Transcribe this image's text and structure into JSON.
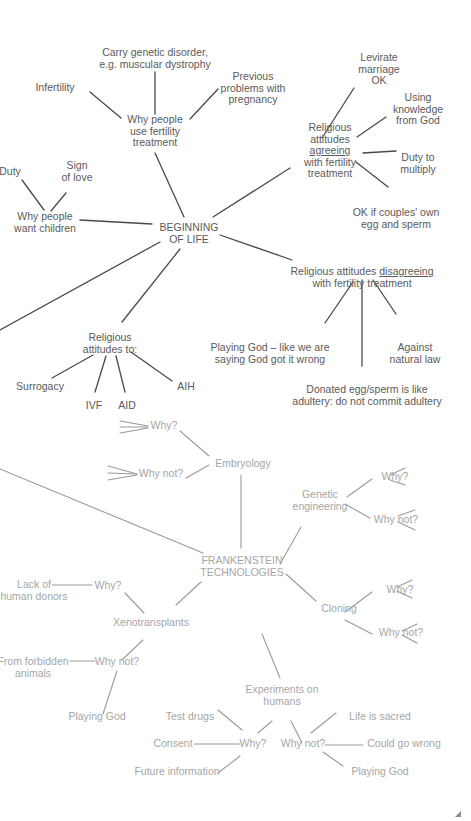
{
  "colors": {
    "dark_text": "#5a5a5a",
    "dark_line": "#4a4a4a",
    "light_text": "#a6a6a6",
    "light_line": "#9a9a9a",
    "background": "#ffffff"
  },
  "beginning_of_life": {
    "center": {
      "lines": [
        "BEGINNING",
        "OF LIFE"
      ]
    },
    "why_fertility": {
      "label": {
        "lines": [
          "Why people",
          "use fertility",
          "treatment"
        ]
      },
      "reasons": [
        {
          "lines": [
            "Carry genetic disorder,",
            "e.g. muscular dystrophy"
          ]
        },
        {
          "lines": [
            "Infertility"
          ]
        },
        {
          "lines": [
            "Previous",
            "problems with",
            "pregnancy"
          ]
        }
      ]
    },
    "why_children": {
      "label": {
        "lines": [
          "Why people",
          "want children"
        ]
      },
      "reasons": [
        {
          "lines": [
            "Duty"
          ]
        },
        {
          "lines": [
            "Sign",
            "of love"
          ]
        }
      ]
    },
    "agreeing": {
      "label": {
        "lines": [
          "Religious",
          "attitudes",
          "agreeing",
          "with fertility",
          "treatment"
        ],
        "underline_line": 2
      },
      "points": [
        {
          "lines": [
            "Levirate",
            "marriage",
            "OK"
          ]
        },
        {
          "lines": [
            "Using",
            "knowledge",
            "from God"
          ]
        },
        {
          "lines": [
            "Duty to",
            "multiply"
          ]
        },
        {
          "lines": [
            "OK if couples' own",
            "egg and sperm"
          ]
        }
      ]
    },
    "disagreeing": {
      "label": {
        "prefix": "Religious attitudes ",
        "underlined": "disagreeing",
        "line2": "with fertility treatment"
      },
      "points": [
        {
          "lines": [
            "Playing God – like we are",
            "saying God got it wrong"
          ]
        },
        {
          "lines": [
            "Against",
            "natural law"
          ]
        },
        {
          "lines": [
            "Donated egg/sperm is like",
            "adultery: do not commit adultery"
          ]
        }
      ]
    },
    "attitudes_to": {
      "label": {
        "lines": [
          "Religious",
          "attitudes to:"
        ]
      },
      "items": [
        {
          "lines": [
            "Surrogacy"
          ]
        },
        {
          "lines": [
            "IVF"
          ]
        },
        {
          "lines": [
            "AID"
          ]
        },
        {
          "lines": [
            "AIH"
          ]
        }
      ]
    }
  },
  "frankenstein": {
    "center": {
      "lines": [
        "FRANKENSTEIN",
        "TECHNOLOGIES"
      ]
    },
    "embryology": {
      "label": {
        "lines": [
          "Embryology"
        ]
      },
      "why": {
        "lines": [
          "Why?"
        ]
      },
      "why_not": {
        "lines": [
          "Why not?"
        ]
      }
    },
    "genetic_engineering": {
      "label": {
        "lines": [
          "Genetic",
          "engineering"
        ]
      },
      "why": {
        "lines": [
          "Why?"
        ]
      },
      "why_not": {
        "lines": [
          "Why not?"
        ]
      }
    },
    "cloning": {
      "label": {
        "lines": [
          "Cloning"
        ]
      },
      "why": {
        "lines": [
          "Why?"
        ]
      },
      "why_not": {
        "lines": [
          "Why not?"
        ]
      }
    },
    "xenotransplants": {
      "label": {
        "lines": [
          "Xenotransplants"
        ]
      },
      "why": {
        "lines": [
          "Why?"
        ]
      },
      "why_reason": {
        "lines": [
          "Lack of",
          "human donors"
        ]
      },
      "why_not": {
        "lines": [
          "Why not?"
        ]
      },
      "why_not_reasons": [
        {
          "lines": [
            "From forbidden",
            "animals"
          ]
        },
        {
          "lines": [
            "Playing God"
          ]
        }
      ]
    },
    "experiments": {
      "label": {
        "lines": [
          "Experiments on",
          "humans"
        ]
      },
      "why": {
        "lines": [
          "Why?"
        ]
      },
      "why_reasons": [
        {
          "lines": [
            "Test drugs"
          ]
        },
        {
          "lines": [
            "Consent"
          ]
        },
        {
          "lines": [
            "Future information"
          ]
        }
      ],
      "why_not": {
        "lines": [
          "Why not?"
        ]
      },
      "why_not_reasons": [
        {
          "lines": [
            "Life is sacred"
          ]
        },
        {
          "lines": [
            "Could go wrong"
          ]
        },
        {
          "lines": [
            "Playing God"
          ]
        }
      ]
    }
  },
  "edges": {
    "dark": [
      [
        155,
        72,
        155,
        114
      ],
      [
        90,
        92,
        121,
        118
      ],
      [
        218,
        89,
        190,
        119
      ],
      [
        155,
        153,
        184,
        217
      ],
      [
        22,
        180,
        44,
        210
      ],
      [
        66,
        193,
        51,
        211
      ],
      [
        80,
        220,
        152,
        224
      ],
      [
        213,
        217,
        290,
        168
      ],
      [
        354,
        88,
        322,
        138
      ],
      [
        386,
        117,
        357,
        137
      ],
      [
        396,
        151,
        363,
        153
      ],
      [
        356,
        162,
        388,
        187
      ],
      [
        220,
        235,
        292,
        260
      ],
      [
        353,
        282,
        325,
        323
      ],
      [
        362,
        280,
        362,
        366
      ],
      [
        373,
        280,
        396,
        314
      ],
      [
        160,
        242,
        0,
        330
      ],
      [
        180,
        249,
        122,
        322
      ],
      [
        93,
        355,
        52,
        378
      ],
      [
        106,
        356,
        95,
        392
      ],
      [
        116,
        356,
        125,
        392
      ],
      [
        131,
        352,
        172,
        381
      ]
    ],
    "light": [
      [
        120,
        421,
        148,
        426
      ],
      [
        120,
        427,
        148,
        427
      ],
      [
        120,
        433,
        148,
        428
      ],
      [
        108,
        466,
        137,
        474
      ],
      [
        108,
        473,
        137,
        474
      ],
      [
        108,
        480,
        137,
        475
      ],
      [
        180,
        431,
        209,
        456
      ],
      [
        186,
        478,
        209,
        465
      ],
      [
        241,
        475,
        241,
        548
      ],
      [
        0,
        469,
        203,
        553
      ],
      [
        280,
        564,
        301,
        527
      ],
      [
        347,
        497,
        372,
        479
      ],
      [
        345,
        504,
        370,
        518
      ],
      [
        390,
        475,
        405,
        468
      ],
      [
        390,
        480,
        405,
        485
      ],
      [
        398,
        516,
        415,
        510
      ],
      [
        398,
        522,
        415,
        530
      ],
      [
        286,
        574,
        316,
        601
      ],
      [
        345,
        612,
        372,
        592
      ],
      [
        345,
        620,
        372,
        634
      ],
      [
        397,
        587,
        412,
        580
      ],
      [
        397,
        591,
        412,
        598
      ],
      [
        402,
        631,
        417,
        624
      ],
      [
        402,
        635,
        417,
        643
      ],
      [
        52,
        585,
        92,
        585
      ],
      [
        125,
        593,
        144,
        613
      ],
      [
        176,
        605,
        201,
        582
      ],
      [
        70,
        661,
        95,
        661
      ],
      [
        143,
        640,
        122,
        660
      ],
      [
        117,
        671,
        103,
        714
      ],
      [
        262,
        634,
        280,
        678
      ],
      [
        218,
        710,
        242,
        730
      ],
      [
        194,
        744,
        240,
        744
      ],
      [
        240,
        756,
        218,
        773
      ],
      [
        272,
        721,
        258,
        733
      ],
      [
        291,
        721,
        302,
        743
      ],
      [
        311,
        733,
        336,
        713
      ],
      [
        325,
        745,
        363,
        745
      ],
      [
        323,
        752,
        343,
        766
      ]
    ]
  },
  "nodes": [
    {
      "id": "carry_genetic",
      "x": 155,
      "y": 47,
      "cls": "dark",
      "ref": "beginning_of_life.why_fertility.reasons.0.lines",
      "name": "node-carry-genetic-disorder"
    },
    {
      "id": "infertility",
      "x": 55,
      "y": 82,
      "cls": "dark",
      "ref": "beginning_of_life.why_fertility.reasons.1.lines",
      "name": "node-infertility"
    },
    {
      "id": "previous_problems",
      "x": 253,
      "y": 71,
      "cls": "dark",
      "ref": "beginning_of_life.why_fertility.reasons.2.lines",
      "name": "node-previous-problems-pregnancy"
    },
    {
      "id": "why_fertility",
      "x": 155,
      "y": 114,
      "cls": "dark",
      "ref": "beginning_of_life.why_fertility.label.lines",
      "name": "node-why-use-fertility-treatment"
    },
    {
      "id": "duty",
      "x": 10,
      "y": 166,
      "cls": "dark",
      "ref": "beginning_of_life.why_children.reasons.0.lines",
      "name": "node-duty"
    },
    {
      "id": "sign_love",
      "x": 77,
      "y": 160,
      "cls": "dark",
      "ref": "beginning_of_life.why_children.reasons.1.lines",
      "name": "node-sign-of-love"
    },
    {
      "id": "why_children",
      "x": 45,
      "y": 211,
      "cls": "dark",
      "ref": "beginning_of_life.why_children.label.lines",
      "name": "node-why-want-children"
    },
    {
      "id": "beginning",
      "x": 189,
      "y": 222,
      "cls": "dark",
      "ref": "beginning_of_life.center.lines",
      "name": "node-beginning-of-life"
    },
    {
      "id": "levirate",
      "x": 379,
      "y": 52,
      "cls": "dark",
      "ref": "beginning_of_life.agreeing.points.0.lines",
      "name": "node-levirate-marriage"
    },
    {
      "id": "using_knowledge",
      "x": 418,
      "y": 92,
      "cls": "dark",
      "ref": "beginning_of_life.agreeing.points.1.lines",
      "name": "node-using-knowledge-from-god"
    },
    {
      "id": "agreeing",
      "x": 330,
      "y": 122,
      "cls": "dark",
      "ref": "beginning_of_life.agreeing.label.lines",
      "name": "node-religious-agreeing",
      "underline": 2
    },
    {
      "id": "duty_multiply",
      "x": 418,
      "y": 152,
      "cls": "dark",
      "ref": "beginning_of_life.agreeing.points.2.lines",
      "name": "node-duty-to-multiply"
    },
    {
      "id": "ok_couples",
      "x": 396,
      "y": 207,
      "cls": "dark",
      "ref": "beginning_of_life.agreeing.points.3.lines",
      "name": "node-ok-couples-own"
    },
    {
      "id": "disagreeing",
      "x": 362,
      "y": 266,
      "cls": "dark",
      "ref": "custom_disagreeing",
      "name": "node-religious-disagreeing"
    },
    {
      "id": "playing_god_1",
      "x": 270,
      "y": 342,
      "cls": "dark",
      "ref": "beginning_of_life.disagreeing.points.0.lines",
      "name": "node-playing-god-wrong"
    },
    {
      "id": "against_natural",
      "x": 415,
      "y": 342,
      "cls": "dark",
      "ref": "beginning_of_life.disagreeing.points.1.lines",
      "name": "node-against-natural-law"
    },
    {
      "id": "donated_egg",
      "x": 367,
      "y": 384,
      "cls": "dark",
      "ref": "beginning_of_life.disagreeing.points.2.lines",
      "name": "node-donated-egg-sperm"
    },
    {
      "id": "attitudes_to",
      "x": 110,
      "y": 332,
      "cls": "dark",
      "ref": "beginning_of_life.attitudes_to.label.lines",
      "name": "node-religious-attitudes-to"
    },
    {
      "id": "surrogacy",
      "x": 40,
      "y": 381,
      "cls": "dark",
      "ref": "beginning_of_life.attitudes_to.items.0.lines",
      "name": "node-surrogacy"
    },
    {
      "id": "ivf",
      "x": 94,
      "y": 400,
      "cls": "dark",
      "ref": "beginning_of_life.attitudes_to.items.1.lines",
      "name": "node-ivf"
    },
    {
      "id": "aid",
      "x": 127,
      "y": 400,
      "cls": "dark",
      "ref": "beginning_of_life.attitudes_to.items.2.lines",
      "name": "node-aid"
    },
    {
      "id": "aih",
      "x": 186,
      "y": 381,
      "cls": "dark",
      "ref": "beginning_of_life.attitudes_to.items.3.lines",
      "name": "node-aih"
    },
    {
      "id": "emb_why",
      "x": 164,
      "y": 420,
      "cls": "light",
      "ref": "frankenstein.embryology.why.lines",
      "name": "node-embryology-why"
    },
    {
      "id": "emb_why_not",
      "x": 161,
      "y": 468,
      "cls": "light",
      "ref": "frankenstein.embryology.why_not.lines",
      "name": "node-embryology-why-not"
    },
    {
      "id": "embryology",
      "x": 243,
      "y": 458,
      "cls": "light",
      "ref": "frankenstein.embryology.label.lines",
      "name": "node-embryology"
    },
    {
      "id": "genetic",
      "x": 320,
      "y": 489,
      "cls": "light",
      "ref": "frankenstein.genetic_engineering.label.lines",
      "name": "node-genetic-engineering"
    },
    {
      "id": "ge_why",
      "x": 395,
      "y": 471,
      "cls": "light",
      "ref": "frankenstein.genetic_engineering.why.lines",
      "name": "node-genetic-why"
    },
    {
      "id": "ge_why_not",
      "x": 396,
      "y": 514,
      "cls": "light",
      "ref": "frankenstein.genetic_engineering.why_not.lines",
      "name": "node-genetic-why-not"
    },
    {
      "id": "frankenstein",
      "x": 242,
      "y": 555,
      "cls": "light",
      "ref": "frankenstein.center.lines",
      "name": "node-frankenstein-technologies"
    },
    {
      "id": "cloning",
      "x": 339,
      "y": 603,
      "cls": "light",
      "ref": "frankenstein.cloning.label.lines",
      "name": "node-cloning"
    },
    {
      "id": "cl_why",
      "x": 400,
      "y": 584,
      "cls": "light",
      "ref": "frankenstein.cloning.why.lines",
      "name": "node-cloning-why"
    },
    {
      "id": "cl_why_not",
      "x": 401,
      "y": 627,
      "cls": "light",
      "ref": "frankenstein.cloning.why_not.lines",
      "name": "node-cloning-why-not"
    },
    {
      "id": "lack_donors",
      "x": 34,
      "y": 579,
      "cls": "light",
      "ref": "frankenstein.xenotransplants.why_reason.lines",
      "name": "node-lack-of-human-donors"
    },
    {
      "id": "xeno_why",
      "x": 108,
      "y": 580,
      "cls": "light",
      "ref": "frankenstein.xenotransplants.why.lines",
      "name": "node-xeno-why"
    },
    {
      "id": "xeno",
      "x": 151,
      "y": 617,
      "cls": "light",
      "ref": "frankenstein.xenotransplants.label.lines",
      "name": "node-xenotransplants"
    },
    {
      "id": "forbidden",
      "x": 33,
      "y": 656,
      "cls": "light",
      "ref": "frankenstein.xenotransplants.why_not_reasons.0.lines",
      "name": "node-from-forbidden-animals"
    },
    {
      "id": "xeno_why_not",
      "x": 117,
      "y": 656,
      "cls": "light",
      "ref": "frankenstein.xenotransplants.why_not.lines",
      "name": "node-xeno-why-not"
    },
    {
      "id": "playing_god_2",
      "x": 97,
      "y": 711,
      "cls": "light",
      "ref": "frankenstein.xenotransplants.why_not_reasons.1.lines",
      "name": "node-xeno-playing-god"
    },
    {
      "id": "experiments",
      "x": 282,
      "y": 684,
      "cls": "light",
      "ref": "frankenstein.experiments.label.lines",
      "name": "node-experiments-on-humans"
    },
    {
      "id": "test_drugs",
      "x": 190,
      "y": 711,
      "cls": "light",
      "ref": "frankenstein.experiments.why_reasons.0.lines",
      "name": "node-test-drugs"
    },
    {
      "id": "consent",
      "x": 173,
      "y": 738,
      "cls": "light",
      "ref": "frankenstein.experiments.why_reasons.1.lines",
      "name": "node-consent"
    },
    {
      "id": "future_info",
      "x": 177,
      "y": 766,
      "cls": "light",
      "ref": "frankenstein.experiments.why_reasons.2.lines",
      "name": "node-future-information"
    },
    {
      "id": "exp_why",
      "x": 253,
      "y": 738,
      "cls": "light",
      "ref": "frankenstein.experiments.why.lines",
      "name": "node-experiments-why"
    },
    {
      "id": "exp_why_not",
      "x": 303,
      "y": 738,
      "cls": "light",
      "ref": "frankenstein.experiments.why_not.lines",
      "name": "node-experiments-why-not"
    },
    {
      "id": "life_sacred",
      "x": 380,
      "y": 711,
      "cls": "light",
      "ref": "frankenstein.experiments.why_not_reasons.0.lines",
      "name": "node-life-is-sacred"
    },
    {
      "id": "could_go_wrong",
      "x": 404,
      "y": 738,
      "cls": "light",
      "ref": "frankenstein.experiments.why_not_reasons.1.lines",
      "name": "node-could-go-wrong"
    },
    {
      "id": "playing_god_3",
      "x": 380,
      "y": 766,
      "cls": "light",
      "ref": "frankenstein.experiments.why_not_reasons.2.lines",
      "name": "node-experiments-playing-god"
    }
  ]
}
